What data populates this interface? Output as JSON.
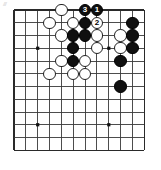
{
  "figure": {
    "kind": "go-board-diagram",
    "scan_mark": "///",
    "background_color": "#ffffff",
    "line_color": "#3a3a3a",
    "border_color": "#2a2a2a",
    "black_color": "#101010",
    "white_color": "#ffffff"
  },
  "board": {
    "label": "go-board",
    "columns": 12,
    "rows": 12,
    "origin_x": 14,
    "origin_y": 10,
    "spacing_x": 11.85,
    "spacing_y": 12.75,
    "stone_radius": 6.2,
    "edges": {
      "top": true,
      "left": true,
      "bottom": true,
      "right": true
    },
    "star_points": [
      {
        "col": 2,
        "row": 3
      },
      {
        "col": 8,
        "row": 3
      },
      {
        "col": 2,
        "row": 9
      },
      {
        "col": 8,
        "row": 9
      }
    ]
  },
  "stones": [
    {
      "color": "white",
      "col": 4,
      "row": 0,
      "label": ""
    },
    {
      "color": "black",
      "col": 6,
      "row": 0,
      "label": "3"
    },
    {
      "color": "black",
      "col": 7,
      "row": 0,
      "label": "1"
    },
    {
      "color": "white",
      "col": 3,
      "row": 1,
      "label": ""
    },
    {
      "color": "white",
      "col": 5,
      "row": 1,
      "label": ""
    },
    {
      "color": "black",
      "col": 6,
      "row": 1,
      "label": ""
    },
    {
      "color": "white",
      "col": 7,
      "row": 1,
      "label": "2"
    },
    {
      "color": "black",
      "col": 10,
      "row": 1,
      "label": ""
    },
    {
      "color": "white",
      "col": 4,
      "row": 2,
      "label": ""
    },
    {
      "color": "black",
      "col": 5,
      "row": 2,
      "label": ""
    },
    {
      "color": "black",
      "col": 6,
      "row": 2,
      "label": ""
    },
    {
      "color": "white",
      "col": 7,
      "row": 2,
      "label": ""
    },
    {
      "color": "white",
      "col": 9,
      "row": 2,
      "label": ""
    },
    {
      "color": "black",
      "col": 10,
      "row": 2,
      "label": ""
    },
    {
      "color": "black",
      "col": 5,
      "row": 3,
      "label": ""
    },
    {
      "color": "white",
      "col": 7,
      "row": 3,
      "label": ""
    },
    {
      "color": "white",
      "col": 9,
      "row": 3,
      "label": ""
    },
    {
      "color": "black",
      "col": 10,
      "row": 3,
      "label": ""
    },
    {
      "color": "white",
      "col": 4,
      "row": 4,
      "label": ""
    },
    {
      "color": "black",
      "col": 5,
      "row": 4,
      "label": ""
    },
    {
      "color": "white",
      "col": 6,
      "row": 4,
      "label": ""
    },
    {
      "color": "black",
      "col": 9,
      "row": 4,
      "label": ""
    },
    {
      "color": "white",
      "col": 3,
      "row": 5,
      "label": ""
    },
    {
      "color": "white",
      "col": 5,
      "row": 5,
      "label": ""
    },
    {
      "color": "white",
      "col": 6,
      "row": 5,
      "label": ""
    },
    {
      "color": "black",
      "col": 9,
      "row": 6,
      "label": ""
    }
  ],
  "move_sequence": [
    {
      "number": "1",
      "color": "black",
      "col": 7,
      "row": 0
    },
    {
      "number": "2",
      "color": "white",
      "col": 7,
      "row": 1
    },
    {
      "number": "3",
      "color": "black",
      "col": 6,
      "row": 0
    }
  ]
}
